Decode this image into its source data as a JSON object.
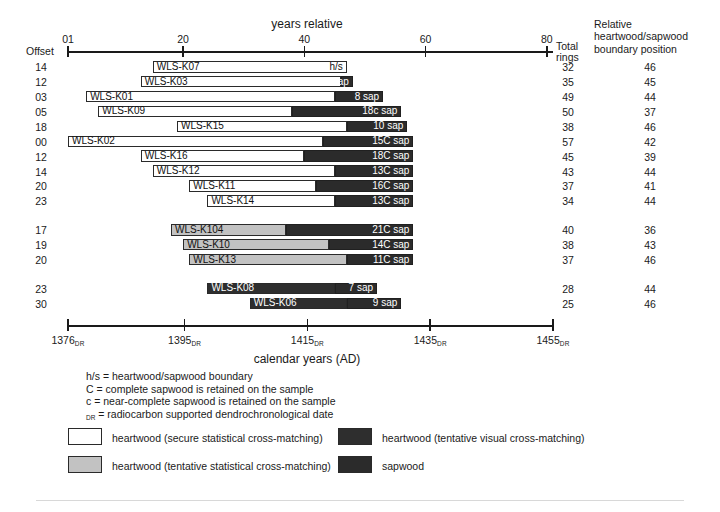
{
  "top_axis": {
    "title": "years relative",
    "offset_word": "Offset",
    "ticks": [
      {
        "value": 1,
        "label": "01"
      },
      {
        "value": 20,
        "label": "20"
      },
      {
        "value": 40,
        "label": "40"
      },
      {
        "value": 60,
        "label": "60"
      },
      {
        "value": 80,
        "label": "80"
      }
    ]
  },
  "columns": {
    "total_rings": "Total\nrings",
    "total_rings_line1": "Total",
    "total_rings_line2": "rings",
    "boundary_line1": "Relative",
    "boundary_line2": "heartwood/sapwood",
    "boundary_line3": "boundary position"
  },
  "bottom_axis": {
    "title": "calendar years (AD)",
    "suffix": "DR",
    "ticks": [
      {
        "value": 1376,
        "label": "1376"
      },
      {
        "value": 1395,
        "label": "1395"
      },
      {
        "value": 1415,
        "label": "1415"
      },
      {
        "value": 1435,
        "label": "1435"
      },
      {
        "value": 1455,
        "label": "1455"
      }
    ]
  },
  "rows": [
    {
      "offset": "14",
      "name": "WLS-K07",
      "start": 14,
      "end": 46,
      "hs": 46,
      "rings": "32",
      "bpos": "46",
      "sap_label": "h/s",
      "heart_style": "white",
      "group": 0
    },
    {
      "offset": "12",
      "name": "WLS-K03",
      "start": 12,
      "end": 47,
      "hs": 45,
      "rings": "35",
      "bpos": "45",
      "sap_label": "2 sap",
      "heart_style": "white",
      "group": 0
    },
    {
      "offset": "03",
      "name": "WLS-K01",
      "start": 3,
      "end": 52,
      "hs": 44,
      "rings": "49",
      "bpos": "44",
      "sap_label": "8 sap",
      "heart_style": "white",
      "group": 0
    },
    {
      "offset": "05",
      "name": "WLS-K09",
      "start": 5,
      "end": 55,
      "hs": 37,
      "rings": "50",
      "bpos": "37",
      "sap_label": "18c sap",
      "heart_style": "white",
      "group": 0
    },
    {
      "offset": "18",
      "name": "WLS-K15",
      "start": 18,
      "end": 56,
      "hs": 46,
      "rings": "38",
      "bpos": "46",
      "sap_label": "10 sap",
      "heart_style": "white",
      "group": 0
    },
    {
      "offset": "00",
      "name": "WLS-K02",
      "start": 0,
      "end": 57,
      "hs": 42,
      "rings": "57",
      "bpos": "42",
      "sap_label": "15C sap",
      "heart_style": "white",
      "group": 0
    },
    {
      "offset": "12",
      "name": "WLS-K16",
      "start": 12,
      "end": 57,
      "hs": 39,
      "rings": "45",
      "bpos": "39",
      "sap_label": "18C sap",
      "heart_style": "white",
      "group": 0
    },
    {
      "offset": "14",
      "name": "WLS-K12",
      "start": 14,
      "end": 57,
      "hs": 44,
      "rings": "43",
      "bpos": "44",
      "sap_label": "13C sap",
      "heart_style": "white",
      "group": 0
    },
    {
      "offset": "20",
      "name": "WLS-K11",
      "start": 20,
      "end": 57,
      "hs": 41,
      "rings": "37",
      "bpos": "41",
      "sap_label": "16C sap",
      "heart_style": "white",
      "group": 0
    },
    {
      "offset": "23",
      "name": "WLS-K14",
      "start": 23,
      "end": 57,
      "hs": 44,
      "rings": "34",
      "bpos": "44",
      "sap_label": "13C sap",
      "heart_style": "white",
      "group": 0
    },
    {
      "offset": "17",
      "name": "WLS-K104",
      "start": 17,
      "end": 57,
      "hs": 36,
      "rings": "40",
      "bpos": "36",
      "sap_label": "21C sap",
      "heart_style": "gray",
      "group": 1
    },
    {
      "offset": "19",
      "name": "WLS-K10",
      "start": 19,
      "end": 57,
      "hs": 43,
      "rings": "38",
      "bpos": "43",
      "sap_label": "14C sap",
      "heart_style": "gray",
      "group": 1
    },
    {
      "offset": "20",
      "name": "WLS-K13",
      "start": 20,
      "end": 57,
      "hs": 46,
      "rings": "37",
      "bpos": "46",
      "sap_label": "11C sap",
      "heart_style": "gray",
      "group": 1
    },
    {
      "offset": "23",
      "name": "WLS-K08",
      "start": 23,
      "end": 51,
      "hs": 44,
      "rings": "28",
      "bpos": "44",
      "sap_label": "7 sap",
      "heart_style": "dark",
      "group": 2
    },
    {
      "offset": "30",
      "name": "WLS-K06",
      "start": 30,
      "end": 55,
      "hs": 46,
      "rings": "25",
      "bpos": "46",
      "sap_label": "9 sap",
      "heart_style": "dark",
      "group": 2
    }
  ],
  "notes": [
    {
      "text": "h/s = heartwood/sapwood boundary",
      "sub": ""
    },
    {
      "text": "C = complete sapwood is retained on the sample",
      "sub": ""
    },
    {
      "text": "c = near-complete sapwood is retained on the sample",
      "sub": ""
    },
    {
      "text": " = radiocarbon supported dendrochronological date",
      "sub": "DR"
    }
  ],
  "legend": [
    {
      "label": "heartwood (secure statistical cross-matching)",
      "swatch": "white"
    },
    {
      "label": "heartwood (tentative visual cross-matching)",
      "swatch": "dark"
    },
    {
      "label": "heartwood (tentative statistical cross-matching)",
      "swatch": "gray"
    },
    {
      "label": "sapwood",
      "swatch": "sap"
    }
  ],
  "colors": {
    "heartwood_secure": "#ffffff",
    "heartwood_tentative_stat": "#c2c2c2",
    "heartwood_tentative_vis": "#2e2e2e",
    "sapwood": "#2b2b2b",
    "axis": "#1a1a1a"
  },
  "chart_data": {
    "type": "bar",
    "title": "years relative",
    "xlabel": "calendar years (AD)",
    "ylabel": "",
    "xlim": [
      0,
      82
    ],
    "grid": false,
    "legend_position": "bottom",
    "categories": [
      "WLS-K07",
      "WLS-K03",
      "WLS-K01",
      "WLS-K09",
      "WLS-K15",
      "WLS-K02",
      "WLS-K16",
      "WLS-K12",
      "WLS-K11",
      "WLS-K14",
      "WLS-K104",
      "WLS-K10",
      "WLS-K13",
      "WLS-K08",
      "WLS-K06"
    ],
    "series": [
      {
        "name": "offset (relative start year)",
        "values": [
          14,
          12,
          3,
          5,
          18,
          0,
          12,
          14,
          20,
          23,
          17,
          19,
          20,
          23,
          30
        ]
      },
      {
        "name": "total rings",
        "values": [
          32,
          35,
          49,
          50,
          38,
          57,
          45,
          43,
          37,
          34,
          40,
          38,
          37,
          28,
          25
        ]
      },
      {
        "name": "heartwood/sapwood boundary position",
        "values": [
          46,
          45,
          44,
          37,
          46,
          42,
          39,
          44,
          41,
          44,
          36,
          43,
          46,
          44,
          46
        ]
      }
    ],
    "annotations": [
      "h/s",
      "2 sap",
      "8 sap",
      "18c sap",
      "10 sap",
      "15C sap",
      "18C sap",
      "13C sap",
      "16C sap",
      "13C sap",
      "21C sap",
      "14C sap",
      "11C sap",
      "7 sap",
      "9 sap"
    ]
  }
}
